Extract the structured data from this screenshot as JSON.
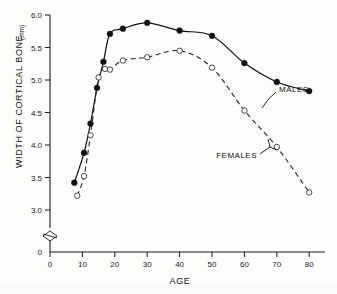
{
  "figure": {
    "background_color": "#fdfdfb",
    "ink_color": "#111111"
  },
  "chart_data": {
    "type": "scatter",
    "title": "",
    "subtitle": "",
    "xlabel": "AGE",
    "ylabel": "WIDTH OF CORTICAL BONE",
    "ylabel_units": "(mm)",
    "xlim": [
      0,
      85
    ],
    "ylim": [
      2.85,
      6.05
    ],
    "y_axis_break": true,
    "y_axis_break_label": "0",
    "grid": false,
    "legend_position": "inline-annotation",
    "xticks": [
      0,
      10,
      20,
      30,
      40,
      50,
      60,
      70,
      80
    ],
    "xticklabels": [
      "0",
      "10",
      "20",
      "30",
      "40",
      "50",
      "60",
      "70",
      "80"
    ],
    "yticks": [
      3.0,
      3.5,
      4.0,
      4.5,
      5.0,
      5.5,
      6.0
    ],
    "yticklabels": [
      "3.0",
      "3.5",
      "4.0",
      "4.5",
      "5.0",
      "5.5",
      "6.0"
    ],
    "annotations": [
      {
        "text": "MALES",
        "target_series": "MALES"
      },
      {
        "text": "FEMALES",
        "target_series": "FEMALES"
      }
    ],
    "series": [
      {
        "name": "MALES",
        "marker": "filled-circle",
        "line_style": "solid",
        "x": [
          7.5,
          10.5,
          12.5,
          14.5,
          16.5,
          18.5,
          22.5,
          30.0,
          40.0,
          50.0,
          60.0,
          70.0,
          80.0
        ],
        "values": [
          3.42,
          3.88,
          4.33,
          4.88,
          5.28,
          5.71,
          5.79,
          5.88,
          5.76,
          5.68,
          5.26,
          4.97,
          4.83
        ]
      },
      {
        "name": "FEMALES",
        "marker": "open-circle",
        "line_style": "dashed",
        "x": [
          8.4,
          10.5,
          12.5,
          15.0,
          17.0,
          18.5,
          22.5,
          30.0,
          40.0,
          50.0,
          60.0,
          70.0,
          80.0
        ],
        "values": [
          3.22,
          3.52,
          4.15,
          5.04,
          5.17,
          5.16,
          5.3,
          5.35,
          5.45,
          5.19,
          4.53,
          3.97,
          3.27
        ]
      }
    ]
  }
}
